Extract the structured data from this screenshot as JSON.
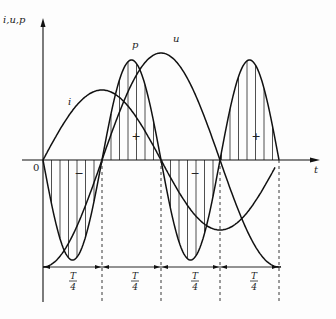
{
  "diagram": {
    "axes": {
      "y_label": "i,u,p",
      "x_label": "t",
      "origin_label": "0"
    },
    "curve_labels": {
      "current": "i",
      "voltage": "u",
      "power": "p"
    },
    "lobe_signs": [
      "−",
      "+",
      "−",
      "+"
    ],
    "quarter_label_num": "T",
    "quarter_label_den": "4",
    "quarters": 4,
    "colors": {
      "stroke": "#111111",
      "hatch": "#222222",
      "background": "#fdfdfd"
    }
  },
  "geometry": {
    "origin_x": 43,
    "axis_y": 160,
    "quarter_px": 59,
    "voltage_amplitude_px": 107,
    "current_amplitude_px": 70,
    "power_amplitude_px": 100,
    "arrow_line_y": 267,
    "hatch_spacing_px": 8.5
  }
}
